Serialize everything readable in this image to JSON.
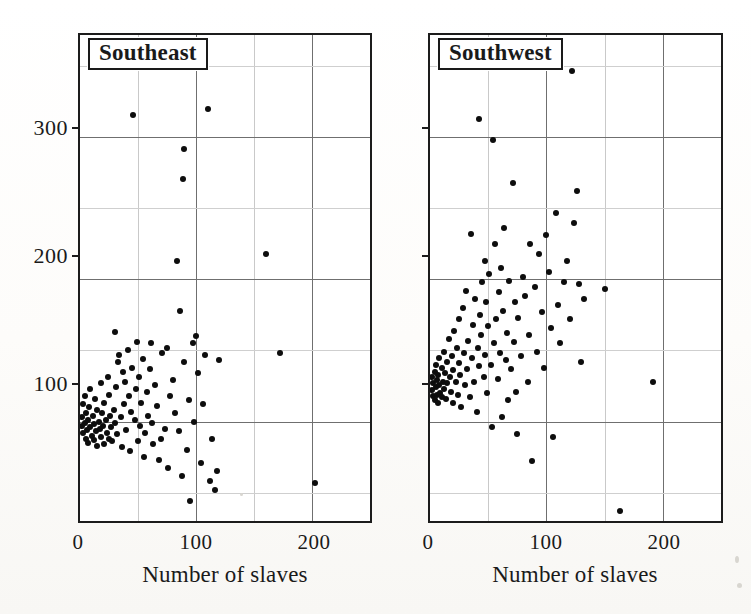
{
  "figure": {
    "background_color": "#fdfdfb",
    "marker_color": "#0d0d0d",
    "frame_color": "#1c1c1c",
    "grid_major_color": "#6f6f6f",
    "grid_minor_color": "#cfcfcf"
  },
  "chart_data": [
    {
      "type": "scatter",
      "title": "Southeast",
      "xlabel": "Number of slaves",
      "ylabel": "",
      "xlim": [
        0,
        250
      ],
      "ylim": [
        30,
        372
      ],
      "xticks": [
        0,
        100,
        200
      ],
      "xtick_labels": [
        "0",
        "100",
        "200"
      ],
      "yticks": [
        100,
        200,
        300
      ],
      "ytick_labels": [
        "100",
        "200",
        "300"
      ],
      "grid": true,
      "grid_major_step_x": 100,
      "grid_minor_step_x": 50,
      "grid_major_step_y": 100,
      "grid_minor_step_y": 50,
      "legend": "none",
      "points": [
        [
          2,
          103
        ],
        [
          2,
          97
        ],
        [
          3,
          112
        ],
        [
          3,
          92
        ],
        [
          4,
          118
        ],
        [
          4,
          99
        ],
        [
          5,
          88
        ],
        [
          5,
          106
        ],
        [
          6,
          94
        ],
        [
          7,
          101
        ],
        [
          7,
          85
        ],
        [
          8,
          110
        ],
        [
          9,
          96
        ],
        [
          9,
          123
        ],
        [
          10,
          90
        ],
        [
          11,
          104
        ],
        [
          12,
          87
        ],
        [
          12,
          98
        ],
        [
          13,
          116
        ],
        [
          14,
          93
        ],
        [
          15,
          108
        ],
        [
          15,
          83
        ],
        [
          16,
          100
        ],
        [
          17,
          95
        ],
        [
          18,
          127
        ],
        [
          18,
          89
        ],
        [
          19,
          106
        ],
        [
          20,
          97
        ],
        [
          21,
          84
        ],
        [
          21,
          113
        ],
        [
          22,
          101
        ],
        [
          23,
          92
        ],
        [
          24,
          131
        ],
        [
          25,
          88
        ],
        [
          25,
          119
        ],
        [
          26,
          104
        ],
        [
          27,
          96
        ],
        [
          28,
          86
        ],
        [
          29,
          108
        ],
        [
          30,
          99
        ],
        [
          30,
          163
        ],
        [
          31,
          124
        ],
        [
          32,
          91
        ],
        [
          33,
          142
        ],
        [
          34,
          147
        ],
        [
          35,
          103
        ],
        [
          36,
          82
        ],
        [
          37,
          135
        ],
        [
          38,
          112
        ],
        [
          39,
          128
        ],
        [
          40,
          94
        ],
        [
          41,
          150
        ],
        [
          42,
          118
        ],
        [
          43,
          79
        ],
        [
          44,
          107
        ],
        [
          45,
          138
        ],
        [
          46,
          316
        ],
        [
          47,
          101
        ],
        [
          48,
          123
        ],
        [
          49,
          156
        ],
        [
          50,
          86
        ],
        [
          51,
          131
        ],
        [
          52,
          97
        ],
        [
          53,
          113
        ],
        [
          54,
          144
        ],
        [
          55,
          75
        ],
        [
          56,
          92
        ],
        [
          58,
          121
        ],
        [
          59,
          104
        ],
        [
          60,
          137
        ],
        [
          61,
          155
        ],
        [
          62,
          99
        ],
        [
          63,
          84
        ],
        [
          65,
          126
        ],
        [
          66,
          111
        ],
        [
          68,
          73
        ],
        [
          70,
          88
        ],
        [
          71,
          148
        ],
        [
          73,
          95
        ],
        [
          75,
          152
        ],
        [
          76,
          67
        ],
        [
          78,
          118
        ],
        [
          80,
          129
        ],
        [
          82,
          106
        ],
        [
          84,
          213
        ],
        [
          85,
          93
        ],
        [
          86,
          178
        ],
        [
          88,
          62
        ],
        [
          89,
          271
        ],
        [
          90,
          292
        ],
        [
          90,
          142
        ],
        [
          92,
          80
        ],
        [
          94,
          115
        ],
        [
          95,
          44
        ],
        [
          97,
          155
        ],
        [
          98,
          100
        ],
        [
          100,
          160
        ],
        [
          102,
          134
        ],
        [
          104,
          71
        ],
        [
          106,
          112
        ],
        [
          108,
          147
        ],
        [
          110,
          320
        ],
        [
          112,
          58
        ],
        [
          114,
          88
        ],
        [
          116,
          52
        ],
        [
          118,
          65
        ],
        [
          120,
          143
        ],
        [
          160,
          218
        ],
        [
          172,
          148
        ],
        [
          203,
          57
        ]
      ]
    },
    {
      "type": "scatter",
      "title": "Southwest",
      "xlabel": "Number of slaves",
      "ylabel": "",
      "xlim": [
        0,
        250
      ],
      "ylim": [
        30,
        372
      ],
      "xticks": [
        0,
        100,
        200
      ],
      "xtick_labels": [
        "0",
        "100",
        "200"
      ],
      "yticks": [
        100,
        200,
        300
      ],
      "ytick_labels": [
        "100",
        "200",
        "300"
      ],
      "grid": true,
      "grid_major_step_x": 100,
      "grid_minor_step_x": 50,
      "grid_major_step_y": 100,
      "grid_minor_step_y": 50,
      "legend": "none",
      "points": [
        [
          2,
          122
        ],
        [
          2,
          131
        ],
        [
          3,
          118
        ],
        [
          3,
          127
        ],
        [
          4,
          135
        ],
        [
          4,
          115
        ],
        [
          5,
          124
        ],
        [
          5,
          140
        ],
        [
          6,
          119
        ],
        [
          6,
          129
        ],
        [
          7,
          133
        ],
        [
          7,
          113
        ],
        [
          8,
          126
        ],
        [
          8,
          145
        ],
        [
          9,
          120
        ],
        [
          10,
          138
        ],
        [
          10,
          117
        ],
        [
          11,
          128
        ],
        [
          12,
          149
        ],
        [
          12,
          123
        ],
        [
          13,
          134
        ],
        [
          14,
          116
        ],
        [
          15,
          142
        ],
        [
          15,
          127
        ],
        [
          16,
          158
        ],
        [
          17,
          131
        ],
        [
          18,
          121
        ],
        [
          19,
          146
        ],
        [
          20,
          136
        ],
        [
          20,
          113
        ],
        [
          21,
          164
        ],
        [
          22,
          128
        ],
        [
          23,
          152
        ],
        [
          24,
          119
        ],
        [
          25,
          172
        ],
        [
          25,
          141
        ],
        [
          26,
          133
        ],
        [
          27,
          110
        ],
        [
          28,
          180
        ],
        [
          29,
          148
        ],
        [
          30,
          126
        ],
        [
          31,
          192
        ],
        [
          32,
          137
        ],
        [
          33,
          157
        ],
        [
          34,
          117
        ],
        [
          35,
          232
        ],
        [
          36,
          145
        ],
        [
          37,
          168
        ],
        [
          38,
          128
        ],
        [
          39,
          186
        ],
        [
          40,
          107
        ],
        [
          41,
          152
        ],
        [
          42,
          313
        ],
        [
          42,
          139
        ],
        [
          43,
          175
        ],
        [
          44,
          161
        ],
        [
          45,
          198
        ],
        [
          46,
          131
        ],
        [
          47,
          213
        ],
        [
          47,
          147
        ],
        [
          48,
          184
        ],
        [
          49,
          120
        ],
        [
          50,
          167
        ],
        [
          51,
          204
        ],
        [
          52,
          140
        ],
        [
          53,
          96
        ],
        [
          54,
          298
        ],
        [
          55,
          155
        ],
        [
          56,
          225
        ],
        [
          57,
          172
        ],
        [
          58,
          130
        ],
        [
          59,
          191
        ],
        [
          60,
          148
        ],
        [
          61,
          208
        ],
        [
          62,
          103
        ],
        [
          63,
          178
        ],
        [
          64,
          236
        ],
        [
          65,
          143
        ],
        [
          66,
          162
        ],
        [
          67,
          115
        ],
        [
          68,
          199
        ],
        [
          70,
          137
        ],
        [
          71,
          268
        ],
        [
          72,
          156
        ],
        [
          73,
          184
        ],
        [
          74,
          121
        ],
        [
          75,
          91
        ],
        [
          76,
          173
        ],
        [
          78,
          146
        ],
        [
          80,
          202
        ],
        [
          82,
          188
        ],
        [
          84,
          128
        ],
        [
          85,
          161
        ],
        [
          86,
          225
        ],
        [
          88,
          72
        ],
        [
          90,
          195
        ],
        [
          92,
          149
        ],
        [
          94,
          218
        ],
        [
          96,
          177
        ],
        [
          98,
          138
        ],
        [
          100,
          231
        ],
        [
          102,
          205
        ],
        [
          104,
          166
        ],
        [
          106,
          89
        ],
        [
          108,
          247
        ],
        [
          110,
          182
        ],
        [
          112,
          155
        ],
        [
          115,
          198
        ],
        [
          118,
          213
        ],
        [
          120,
          172
        ],
        [
          122,
          347
        ],
        [
          124,
          240
        ],
        [
          126,
          262
        ],
        [
          128,
          197
        ],
        [
          130,
          142
        ],
        [
          132,
          186
        ],
        [
          150,
          193
        ],
        [
          163,
          37
        ],
        [
          192,
          128
        ]
      ]
    }
  ],
  "panels": [
    {
      "name": "southeast",
      "title": "Southeast",
      "xlabel": "Number of slaves",
      "xtick_labels": [
        "0",
        "100",
        "200"
      ],
      "ytick_labels": [
        "100",
        "200",
        "300"
      ],
      "show_y_labels": true
    },
    {
      "name": "southwest",
      "title": "Southwest",
      "xlabel": "Number of slaves",
      "xtick_labels": [
        "0",
        "100",
        "200"
      ],
      "ytick_labels": [
        "100",
        "200",
        "300"
      ],
      "show_y_labels": false
    }
  ]
}
